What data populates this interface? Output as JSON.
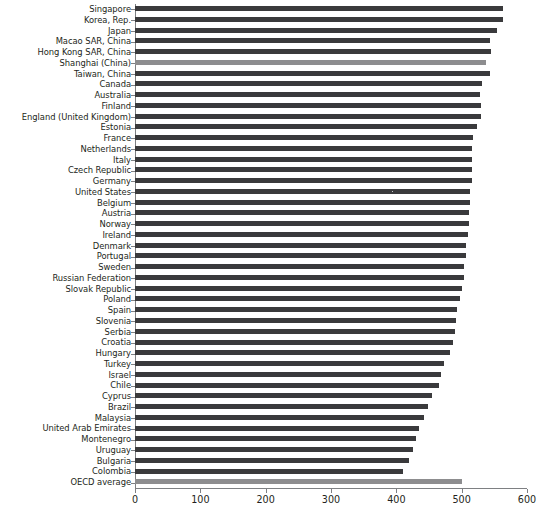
{
  "chart_data": {
    "type": "bar",
    "orientation": "horizontal",
    "title": "",
    "xlabel": "",
    "ylabel": "",
    "xlim": [
      0,
      600
    ],
    "xticks": [
      0,
      100,
      200,
      300,
      400,
      500,
      600
    ],
    "xtick_labels": [
      "0",
      "100",
      "200",
      "300",
      "400",
      "500",
      "600"
    ],
    "grid": false,
    "legend": null,
    "bar_color": "#3a3a3c",
    "highlight_color": "#8d8d8f",
    "highlighted_categories": [
      "Shanghai (China)",
      "OECD average"
    ],
    "categories": [
      "Singapore",
      "Korea, Rep.",
      "Japan",
      "Macao SAR, China",
      "Hong Kong SAR, China",
      "Shanghai (China)",
      "Taiwan, China",
      "Canada",
      "Australia",
      "Finland",
      "England (United Kingdom)",
      "Estonia",
      "France",
      "Netherlands",
      "Italy",
      "Czech Republic",
      "Germany",
      "United States",
      "Belgium",
      "Austria",
      "Norway",
      "Ireland",
      "Denmark",
      "Portugal",
      "Sweden",
      "Russian Federation",
      "Slovak Republic",
      "Poland",
      "Spain",
      "Slovenia",
      "Serbia",
      "Croatia",
      "Hungary",
      "Turkey",
      "Israel",
      "Chile",
      "Cyprus",
      "Brazil",
      "Malaysia",
      "United Arab Emirates",
      "Montenegro",
      "Uruguay",
      "Bulgaria",
      "Colombia",
      "OECD average"
    ],
    "values": [
      563,
      564,
      554,
      544,
      545,
      537,
      543,
      531,
      528,
      529,
      529,
      523,
      518,
      516,
      516,
      516,
      516,
      512,
      512,
      511,
      511,
      509,
      507,
      507,
      504,
      503,
      500,
      497,
      493,
      492,
      490,
      487,
      482,
      473,
      468,
      465,
      454,
      449,
      442,
      435,
      430,
      425,
      420,
      410,
      501
    ]
  }
}
